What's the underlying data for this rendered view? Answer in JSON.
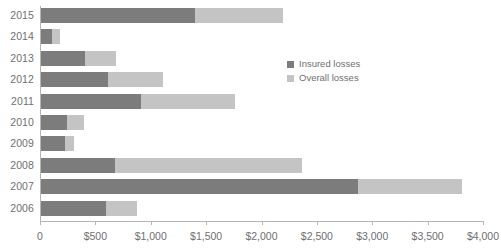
{
  "chart_data": {
    "type": "bar",
    "orientation": "horizontal",
    "stacked": false,
    "title": "",
    "subtitle": "",
    "xlabel": "",
    "ylabel": "",
    "xlim": [
      0,
      4000
    ],
    "grid": false,
    "legend_position": "inside-right",
    "categories": [
      "2015",
      "2014",
      "2013",
      "2012",
      "2011",
      "2010",
      "2009",
      "2008",
      "2007",
      "2006"
    ],
    "xtick_values": [
      0,
      500,
      1000,
      1500,
      2000,
      2500,
      3000,
      3500,
      4000
    ],
    "xtick_labels": [
      "0",
      "$500",
      "$1,000",
      "$1,500",
      "$2,000",
      "$2,500",
      "$3,000",
      "$3,500",
      "$4,000"
    ],
    "series": [
      {
        "name": "Insured losses",
        "color": "#7c7c7c",
        "values": [
          1400,
          110,
          405,
          610,
          910,
          240,
          230,
          680,
          2870,
          595
        ]
      },
      {
        "name": "Overall losses",
        "color": "#c4c4c4",
        "values": [
          2195,
          180,
          690,
          1110,
          1760,
          395,
          305,
          2370,
          3810,
          875
        ]
      }
    ]
  },
  "legend": {
    "items": [
      {
        "label": "Insured losses",
        "color": "#7c7c7c"
      },
      {
        "label": "Overall losses",
        "color": "#c4c4c4"
      }
    ]
  },
  "colors": {
    "insured": "#7c7c7c",
    "overall": "#c4c4c4",
    "axis": "#b5b5b5",
    "text": "#6f6f6f",
    "background": "#ffffff"
  }
}
